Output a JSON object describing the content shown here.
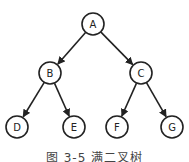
{
  "diagram": {
    "type": "binary-tree",
    "nodes": [
      {
        "id": "A",
        "label": "A",
        "x": 93,
        "y": 24
      },
      {
        "id": "B",
        "label": "B",
        "x": 50,
        "y": 73
      },
      {
        "id": "C",
        "label": "C",
        "x": 141,
        "y": 73
      },
      {
        "id": "D",
        "label": "D",
        "x": 17,
        "y": 127
      },
      {
        "id": "E",
        "label": "E",
        "x": 74,
        "y": 127
      },
      {
        "id": "F",
        "label": "F",
        "x": 117,
        "y": 127
      },
      {
        "id": "G",
        "label": "G",
        "x": 172,
        "y": 127
      }
    ],
    "edges": [
      {
        "from": "A",
        "to": "B"
      },
      {
        "from": "A",
        "to": "C"
      },
      {
        "from": "B",
        "to": "D"
      },
      {
        "from": "B",
        "to": "E"
      },
      {
        "from": "C",
        "to": "F"
      },
      {
        "from": "C",
        "to": "G"
      }
    ],
    "caption": "图 3-5  满二叉树"
  }
}
